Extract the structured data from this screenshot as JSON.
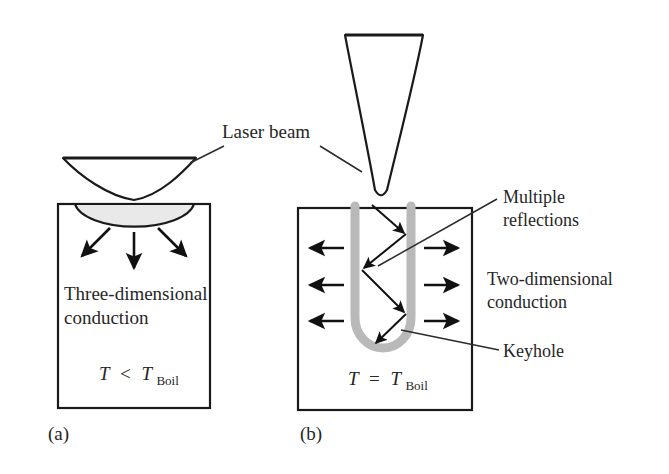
{
  "figure": {
    "type": "technical-diagram",
    "background_color": "#ffffff",
    "ink_color": "#1a1a1a",
    "keyhole_color": "#b9b9b9",
    "melt_pool_color": "#e9e9e9"
  },
  "shared_labels": {
    "laser_beam": "Laser beam"
  },
  "panel_a": {
    "id": "(a)",
    "beam_name": "laser-beam-cone-a",
    "melt_pool_name": "melt-pool",
    "conduction_label_line1": "Three-dimensional",
    "conduction_label_line2": "conduction",
    "temperature": {
      "symbol": "T",
      "operator": "<",
      "reference_symbol": "T",
      "reference_subscript": "Boil",
      "full": "T < T_Boil"
    },
    "heat_flow_arrows": 3
  },
  "panel_b": {
    "id": "(b)",
    "beam_name": "laser-beam-cone-b",
    "keyhole_label": "Keyhole",
    "reflections_label_line1": "Multiple",
    "reflections_label_line2": "reflections",
    "conduction_label_line1": "Two-dimensional",
    "conduction_label_line2": "conduction",
    "temperature": {
      "symbol": "T",
      "operator": "=",
      "reference_symbol": "T",
      "reference_subscript": "Boil",
      "full": "T = T_Boil"
    },
    "heat_flow_arrows_left": 3,
    "heat_flow_arrows_right": 3,
    "reflection_bounces": 4
  }
}
